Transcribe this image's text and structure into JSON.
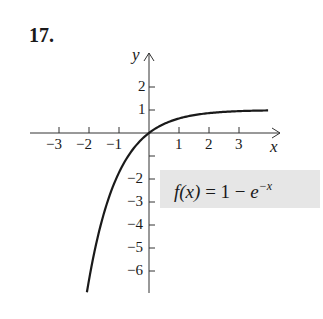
{
  "problem": {
    "number": "17."
  },
  "chart_data": {
    "type": "line",
    "title": "",
    "xlabel": "x",
    "ylabel": "y",
    "function_label": "f(x) = 1 − e^(−x)",
    "function_parts": {
      "lhs": "f(x)",
      "eq": " = 1 − ",
      "base": "e",
      "exponent": "−x"
    },
    "x_ticks": [
      -3,
      -2,
      -1,
      1,
      2,
      3
    ],
    "x_tick_labels": [
      "−3",
      "−2",
      "−1",
      "1",
      "2",
      "3"
    ],
    "y_ticks": [
      2,
      1,
      -1,
      -2,
      -3,
      -4,
      -5,
      -6
    ],
    "y_tick_labels": [
      "2",
      "1",
      "",
      "−2",
      "−3",
      "−4",
      "−5",
      "−6"
    ],
    "xlim": [
      -4,
      4.4
    ],
    "ylim": [
      -7,
      3.5
    ],
    "grid": false,
    "series": [
      {
        "name": "f(x) = 1 − e^(−x)",
        "x": [
          -2.07,
          -2.0,
          -1.5,
          -1.0,
          -0.5,
          0,
          0.5,
          1.0,
          1.5,
          2.0,
          2.5,
          3.0,
          3.5,
          3.97
        ],
        "y": [
          -6.92,
          -6.39,
          -3.48,
          -1.72,
          -0.65,
          0,
          0.39,
          0.63,
          0.78,
          0.86,
          0.92,
          0.95,
          0.97,
          0.98
        ]
      }
    ],
    "annotation_box_color": "#e6e6e6",
    "line_color": "#1a1a1a"
  }
}
